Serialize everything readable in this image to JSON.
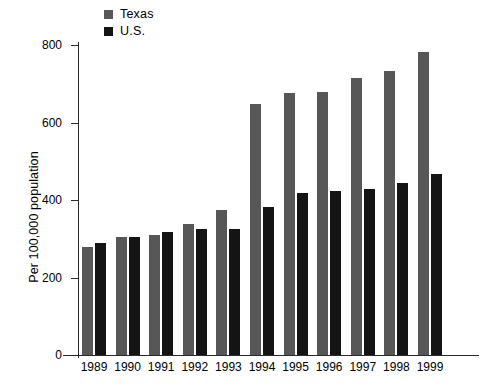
{
  "chart_data": {
    "type": "bar",
    "title": "",
    "subtitle": "",
    "xlabel": "",
    "ylabel": "Per 100,000 population",
    "categories": [
      "1989",
      "1990",
      "1991",
      "1992",
      "1993",
      "1994",
      "1995",
      "1996",
      "1997",
      "1998",
      "1999"
    ],
    "series": [
      {
        "name": "Texas",
        "color": "#575757",
        "values": [
          278,
          305,
          311,
          338,
          374,
          648,
          676,
          680,
          716,
          733,
          783
        ]
      },
      {
        "name": "U.S.",
        "color": "#141414",
        "values": [
          288,
          305,
          317,
          325,
          324,
          383,
          419,
          424,
          429,
          444,
          468
        ]
      }
    ],
    "ylim": [
      0,
      800
    ],
    "yticks": [
      0,
      200,
      400,
      600,
      800
    ],
    "ytick_labels": [
      "0",
      "200",
      "400",
      "600",
      "800"
    ],
    "grid": false,
    "legend_position": "top-left"
  },
  "legend": {
    "items": [
      {
        "label": "Texas",
        "swatch": "#575757"
      },
      {
        "label": "U.S.",
        "swatch": "#141414"
      }
    ]
  },
  "axes": {
    "y_title": "Per 100,000 population",
    "y_tick_labels": [
      "800",
      "600",
      "400",
      "200",
      "0"
    ],
    "x_tick_labels": [
      "1989",
      "1990",
      "1991",
      "1992",
      "1993",
      "1994",
      "1995",
      "1996",
      "1997",
      "1998",
      "1999"
    ]
  }
}
